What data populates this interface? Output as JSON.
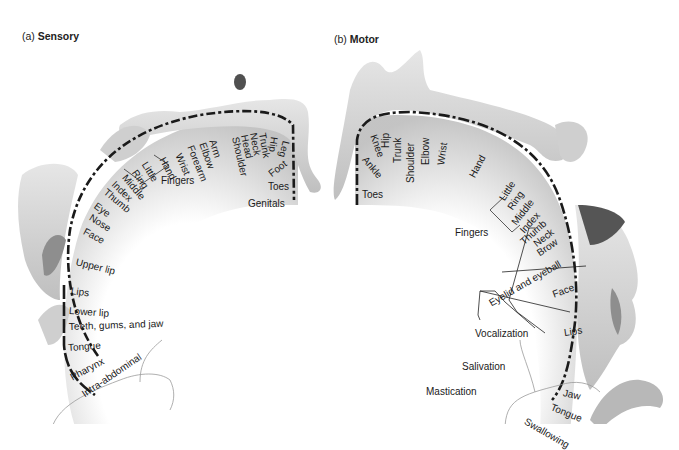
{
  "panels": {
    "sensory": {
      "prefix": "(a)",
      "title": "Sensory",
      "group_label": "Fingers",
      "regions": [
        "Genitals",
        "Toes",
        "Foot",
        "Leg",
        "Hip",
        "Trunk",
        "Neck",
        "Head",
        "Shoulder",
        "Arm",
        "Elbow",
        "Forearm",
        "Wrist",
        "Hand",
        "Little",
        "Ring",
        "Middle",
        "Index",
        "Thumb",
        "Eye",
        "Nose",
        "Face",
        "Upper lip",
        "Lips",
        "Lower lip",
        "Teeth, gums, and jaw",
        "Tongue",
        "Pharynx",
        "Intra-abdominal"
      ]
    },
    "motor": {
      "prefix": "(b)",
      "title": "Motor",
      "group_label": "Fingers",
      "regions": [
        "Toes",
        "Ankle",
        "Knee",
        "Hip",
        "Trunk",
        "Shoulder",
        "Elbow",
        "Wrist",
        "Hand",
        "Little",
        "Ring",
        "Middle",
        "Index",
        "Thumb",
        "Neck",
        "Brow",
        "Eyelid and eyeball",
        "Face",
        "Lips",
        "Jaw",
        "Tongue",
        "Swallowing"
      ],
      "functions": [
        "Vocalization",
        "Salivation",
        "Mastication"
      ]
    }
  },
  "colors": {
    "dash": "#1a1a1a",
    "cortex_shade": "#c8c8c8",
    "figure": "#d9d9d9",
    "hair": "#5a5a5a"
  }
}
